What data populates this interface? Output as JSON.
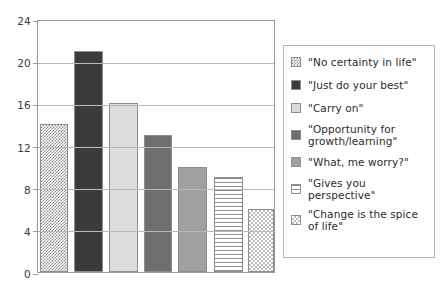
{
  "chart_data": {
    "type": "bar",
    "title": "",
    "xlabel": "",
    "ylabel": "",
    "ylim": [
      0,
      24
    ],
    "yticks": [
      0,
      4,
      8,
      12,
      16,
      20,
      24
    ],
    "ytick_labels": [
      "0",
      "4",
      "8",
      "12",
      "16",
      "20",
      "24"
    ],
    "grid": true,
    "legend_position": "right",
    "categories": [
      "\"No certainty in life\"",
      "\"Just do your best\"",
      "\"Carry on\"",
      "\"Opportunity for growth/learning\"",
      "\"What, me worry?\"",
      "\"Gives you perspective\"",
      "\"Change is the spice of life\""
    ],
    "values": [
      14,
      21,
      16,
      13,
      10,
      9,
      6
    ],
    "series": [
      {
        "name": "responses",
        "values": [
          14,
          21,
          16,
          13,
          10,
          9,
          6
        ]
      }
    ]
  },
  "axis": {
    "y_ticks": [
      {
        "label": "24",
        "value": 24
      },
      {
        "label": "20",
        "value": 20
      },
      {
        "label": "16",
        "value": 16
      },
      {
        "label": "12",
        "value": 12
      },
      {
        "label": "8",
        "value": 8
      },
      {
        "label": "4",
        "value": 4
      },
      {
        "label": "0",
        "value": 0
      }
    ]
  },
  "bars": [
    {
      "label": "\"No certainty in life\"",
      "value": 14,
      "pattern": "checker-mid",
      "color": "#8b8b8b"
    },
    {
      "label": "\"Just do your best\"",
      "value": 21,
      "pattern": "solid-dark",
      "color": "#3b3b3b"
    },
    {
      "label": "\"Carry on\"",
      "value": 16,
      "pattern": "solid-light",
      "color": "#dcdcdc"
    },
    {
      "label": "\"Opportunity for growth/learning\"",
      "value": 13,
      "pattern": "solid-darkgray",
      "color": "#6e6e6e"
    },
    {
      "label": "\"What, me worry?\"",
      "value": 10,
      "pattern": "solid-midgray",
      "color": "#a0a0a0"
    },
    {
      "label": "\"Gives you perspective\"",
      "value": 9,
      "pattern": "hlines",
      "color": "#8f8f8f"
    },
    {
      "label": "\"Change is the spice of life\"",
      "value": 6,
      "pattern": "checker-light",
      "color": "#bdbdbd"
    }
  ],
  "legend": {
    "items": [
      {
        "label": "\"No certainty in life\"",
        "pattern": "checker-mid"
      },
      {
        "label": "\"Just do your best\"",
        "pattern": "solid-dark"
      },
      {
        "label": "\"Carry on\"",
        "pattern": "solid-light"
      },
      {
        "label": "\"Opportunity for growth/learning\"",
        "pattern": "solid-darkgray"
      },
      {
        "label": "\"What, me worry?\"",
        "pattern": "solid-midgray"
      },
      {
        "label": "\"Gives you perspective\"",
        "pattern": "hlines"
      },
      {
        "label": "\"Change is the spice of life\"",
        "pattern": "checker-light"
      }
    ]
  }
}
